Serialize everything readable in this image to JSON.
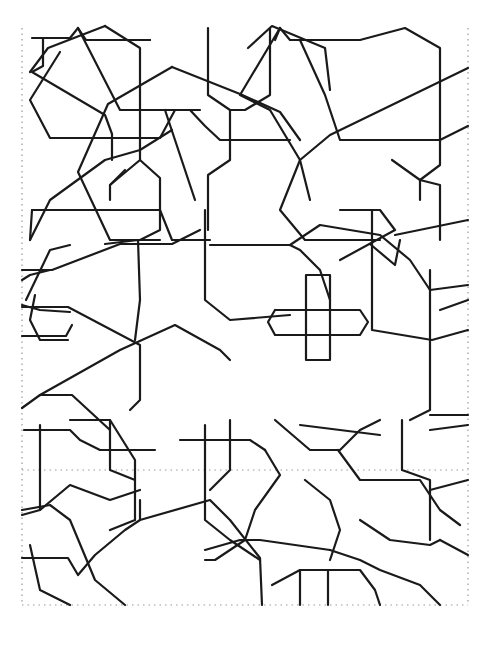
{
  "figure": {
    "title": "",
    "stroke_color": "#1a1a1a",
    "background": "#ffffff",
    "guide_color": "#9a9a9a"
  },
  "guides": [
    "22,28 22,605",
    "468,28 468,605",
    "22,605 468,605",
    "22,470 468,470"
  ],
  "lines": [
    "32,38 70,38 78,28 86,40 150,40",
    "43,38 43,66 32,72 105,115 112,134 112,160",
    "60,52 30,100 50,138 160,138 175,110 200,110",
    "78,28 120,110 162,110",
    "105,26 140,48 140,160 110,185 110,200",
    "30,72 48,48 105,26",
    "172,67 108,104 78,172 110,240 160,240",
    "172,67 240,94 280,112 300,140 300,140",
    "140,160 160,178 160,230 140,240",
    "110,185 125,170",
    "140,110 190,110 205,126 220,140 290,140",
    "150,40 150,40",
    "208,28 208,95 230,110 230,160 208,175 208,230",
    "270,28 270,95 245,110 230,110",
    "275,40 280,28 290,40 360,40",
    "280,28 240,95 270,110 300,160",
    "248,48 272,26 325,48 330,90",
    "300,40 325,95 340,140 440,140 468,126",
    "360,40 405,28 440,48 440,165 420,180 420,200",
    "392,160 420,180 440,185 440,240",
    "468,68 330,135 300,160 310,200",
    "300,160 280,210 305,240 380,240",
    "195,200 165,110",
    "32,210 160,210 172,240 210,240",
    "30,240 50,200 105,160 140,150 172,130",
    "22,280 30,275 50,270",
    "22,270 52,270 120,244 172,244 200,230",
    "22,305 40,310 70,312",
    "35,295 30,320 40,340 68,340",
    "22,307 68,307 140,345 140,400 130,410",
    "22,336 66,336 72,325",
    "26,300 50,250 70,245",
    "32,210 30,240",
    "22,408 40,395 72,395 110,430",
    "40,395 120,350 175,325 220,350 230,360",
    "105,244 138,240 140,300 135,340",
    "205,210 205,300 230,320 290,315",
    "210,245 290,245 300,250 320,270 330,300",
    "290,245 320,225 380,235 410,260 430,290 468,285",
    "340,210 380,210 395,230 340,260",
    "395,235 468,220",
    "370,244 395,265 400,240",
    "306,275 330,275 330,360 306,360 306,275",
    "275,310 360,310 368,322 360,335 275,335 268,322 275,310",
    "372,210 372,330 432,340 468,330",
    "430,270 430,410 410,420",
    "440,310 468,300",
    "430,415 468,415",
    "24,430 70,430 80,440 100,450 155,450",
    "40,425 40,510",
    "22,515 40,510 70,485 110,500 140,490",
    "70,420 110,420 135,460 135,520 110,530",
    "110,420 110,470 135,480",
    "180,440 250,440 265,450",
    "205,425 205,520 230,540 260,560",
    "230,420 230,470 210,490",
    "265,450 280,475 255,510 245,540 215,560 205,560",
    "275,420 310,450 340,450 360,430 380,420",
    "300,425 340,430 380,435",
    "305,480 330,500 340,530 330,560",
    "338,450 360,480 420,480 440,510 460,525",
    "402,420 402,470 430,480 430,540",
    "430,430 468,425",
    "22,510 50,505 70,520 95,580 125,605",
    "22,558 68,558 78,575 95,555 125,530 140,520 140,500",
    "30,545 40,590 70,605",
    "140,520 210,500 230,520 260,558 262,605",
    "205,550 240,540 260,540 330,550",
    "272,585 300,570 360,570 375,590 380,605",
    "300,570 300,605",
    "328,570 328,605",
    "330,550 360,560 380,570 420,585 440,605",
    "360,520 390,540 430,545 440,540",
    "440,540 468,555",
    "430,490 468,480"
  ]
}
